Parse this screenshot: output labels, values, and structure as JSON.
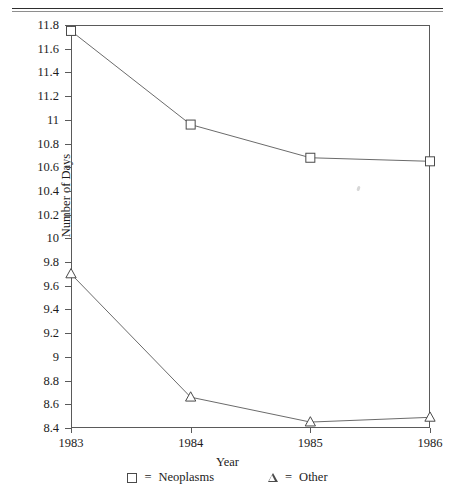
{
  "chart_data": {
    "type": "line",
    "title": "",
    "xlabel": "Year",
    "ylabel": "Number of Days",
    "categories": [
      "1983",
      "1984",
      "1985",
      "1986"
    ],
    "x": [
      1983,
      1984,
      1985,
      1986
    ],
    "xlim": [
      1983,
      1986
    ],
    "ylim": [
      8.4,
      11.8
    ],
    "yticks": [
      "11.8",
      "11.6",
      "11.4",
      "11.2",
      "11",
      "10.8",
      "10.6",
      "10.4",
      "10.2",
      "10",
      "9.8",
      "9.6",
      "9.4",
      "9.2",
      "9",
      "8.8",
      "8.6",
      "8.4"
    ],
    "ytick_values": [
      11.8,
      11.6,
      11.4,
      11.2,
      11.0,
      10.8,
      10.6,
      10.4,
      10.2,
      10.0,
      9.8,
      9.6,
      9.4,
      9.2,
      9.0,
      8.8,
      8.6,
      8.4
    ],
    "grid": false,
    "legend_position": "bottom",
    "series": [
      {
        "name": "Neoplasms",
        "marker": "square",
        "values": [
          11.75,
          10.96,
          10.68,
          10.65
        ]
      },
      {
        "name": "Other",
        "marker": "triangle",
        "values": [
          9.7,
          8.66,
          8.45,
          8.49
        ]
      }
    ]
  },
  "legend": {
    "equals": "=",
    "items": [
      {
        "marker": "square-marker",
        "label": "Neoplasms"
      },
      {
        "marker": "triangle-marker",
        "label": "Other"
      }
    ]
  },
  "colors": {
    "line": "#6b6b6b",
    "marker_stroke": "#4a4a4a",
    "axis": "#5a5a5a",
    "text": "#1c1c1c",
    "background": "#ffffff"
  }
}
